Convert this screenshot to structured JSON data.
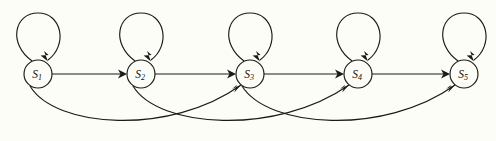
{
  "diagram": {
    "type": "state-machine",
    "background_color": "#fdfdf8",
    "ink_color": "#1a1a1a",
    "nodes": [
      {
        "id": "S1",
        "label_base": "S",
        "label_sub": "1",
        "cx": 38,
        "cy": 74,
        "r": 14
      },
      {
        "id": "S2",
        "label_base": "S",
        "label_sub": "2",
        "cx": 141,
        "cy": 74,
        "r": 14
      },
      {
        "id": "S3",
        "label_base": "S",
        "label_sub": "3",
        "cx": 250,
        "cy": 74,
        "r": 14
      },
      {
        "id": "S4",
        "label_base": "S",
        "label_sub": "4",
        "cx": 358,
        "cy": 74,
        "r": 14
      },
      {
        "id": "S5",
        "label_base": "S",
        "label_sub": "5",
        "cx": 464,
        "cy": 74,
        "r": 14
      }
    ],
    "self_loops": [
      {
        "id": "loop-S1",
        "from": "S1",
        "to": "S1",
        "apex_y": 13
      },
      {
        "id": "loop-S2",
        "from": "S2",
        "to": "S2",
        "apex_y": 13
      },
      {
        "id": "loop-S3",
        "from": "S3",
        "to": "S3",
        "apex_y": 13
      },
      {
        "id": "loop-S4",
        "from": "S4",
        "to": "S4",
        "apex_y": 13
      },
      {
        "id": "loop-S5",
        "from": "S5",
        "to": "S5",
        "apex_y": 13
      }
    ],
    "straight_edges": [
      {
        "id": "edge-S1-S2",
        "from": "S1",
        "to": "S2"
      },
      {
        "id": "edge-S2-S3",
        "from": "S2",
        "to": "S3"
      },
      {
        "id": "edge-S3-S4",
        "from": "S3",
        "to": "S4"
      },
      {
        "id": "edge-S4-S5",
        "from": "S4",
        "to": "S5"
      }
    ],
    "arc_edges": [
      {
        "id": "arc-S1-S3",
        "from": "S1",
        "to": "S3",
        "dip_y": 131
      },
      {
        "id": "arc-S2-S4",
        "from": "S2",
        "to": "S4",
        "dip_y": 131
      },
      {
        "id": "arc-S3-S5",
        "from": "S3",
        "to": "S5",
        "dip_y": 131
      }
    ]
  }
}
